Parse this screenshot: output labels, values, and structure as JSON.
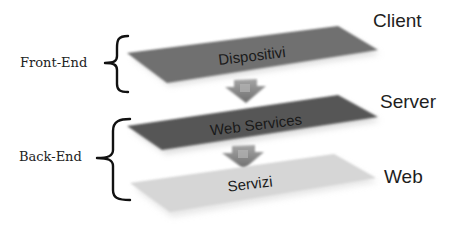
{
  "diagram": {
    "type": "layered-architecture",
    "groups": [
      {
        "id": "front-end",
        "label": "Front-End",
        "spans": [
          "dispositivi"
        ]
      },
      {
        "id": "back-end",
        "label": "Back-End",
        "spans": [
          "web-services",
          "servizi"
        ]
      }
    ],
    "layers": [
      {
        "id": "dispositivi",
        "label": "Dispositivi",
        "tier": "Client",
        "color": "#6f6f6f"
      },
      {
        "id": "web-services",
        "label": "Web Services",
        "tier": "Server",
        "color": "#575757"
      },
      {
        "id": "servizi",
        "label": "Servizi",
        "tier": "Web",
        "color": "#d6d6d6"
      }
    ],
    "arrows": [
      {
        "from": "dispositivi",
        "to": "web-services",
        "direction": "down",
        "color": "#8a8a8a"
      },
      {
        "from": "web-services",
        "to": "servizi",
        "direction": "down",
        "color": "#8a8a8a"
      }
    ]
  }
}
